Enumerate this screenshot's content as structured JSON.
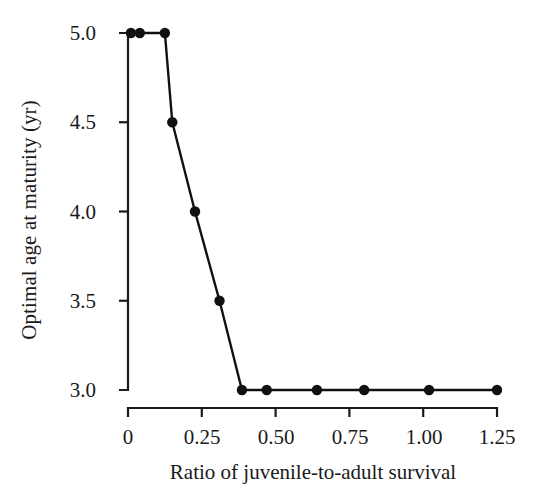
{
  "chart_data": {
    "type": "line",
    "title": "",
    "xlabel": "Ratio of juvenile-to-adult survival",
    "ylabel": "Optimal age at maturity (yr)",
    "xlim": [
      0.0,
      1.25
    ],
    "ylim": [
      3.0,
      5.0
    ],
    "xticks": [
      0,
      0.25,
      0.5,
      0.75,
      1.0,
      1.25
    ],
    "xtick_labels": [
      "0",
      "0.25",
      "0.50",
      "0.75",
      "1.00",
      "1.25"
    ],
    "yticks": [
      3.0,
      3.5,
      4.0,
      4.5,
      5.0
    ],
    "ytick_labels": [
      "3.0",
      "3.5",
      "4.0",
      "4.5",
      "5.0"
    ],
    "grid": false,
    "legend": null,
    "series": [
      {
        "name": "Optimal age at maturity",
        "marker": "filled-circle",
        "color": "#111111",
        "line_color": "#111111",
        "x": [
          0.01,
          0.04,
          0.125,
          0.15,
          0.227,
          0.31,
          0.386,
          0.47,
          0.64,
          0.8,
          1.02,
          1.25
        ],
        "y": [
          5.0,
          5.0,
          5.0,
          4.5,
          4.0,
          3.5,
          3.0,
          3.0,
          3.0,
          3.0,
          3.0,
          3.0
        ]
      }
    ],
    "annotations": []
  },
  "figure": {
    "background_color": "#ffffff",
    "axis_color": "#1a1a1a",
    "accent_color": "#111111"
  }
}
